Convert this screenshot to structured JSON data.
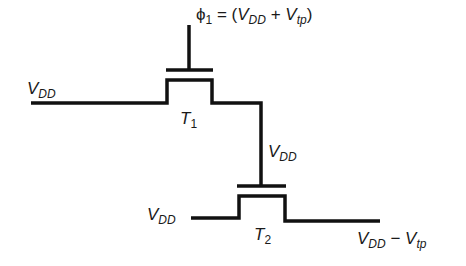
{
  "diagram": {
    "title": "",
    "colors": {
      "line": "#111111",
      "background": "#ffffff",
      "text": "#1a1a1a"
    },
    "gate_label": {
      "symbol": "ϕ",
      "sub": "1",
      "eq": " = (",
      "v1": "V",
      "v1_sub": "DD",
      "plus": " + ",
      "v2": "V",
      "v2_sub": "tp",
      "close": ")"
    },
    "left_vdd": {
      "v": "V",
      "sub": "DD"
    },
    "t1": {
      "t": "T",
      "sub": "1"
    },
    "mid_vdd": {
      "v": "V",
      "sub": "DD"
    },
    "t2_in_vdd": {
      "v": "V",
      "sub": "DD"
    },
    "t2": {
      "t": "T",
      "sub": "2"
    },
    "output": {
      "v1": "V",
      "v1_sub": "DD",
      "minus": " − ",
      "v2": "V",
      "v2_sub": "tp"
    },
    "components": [
      {
        "id": "T1",
        "type": "MOS transistor",
        "gate": "ϕ1 = (VDD + Vtp)",
        "source": "VDD",
        "drain": "gate of T2"
      },
      {
        "id": "T2",
        "type": "MOS transistor",
        "gate": "VDD",
        "input": "VDD",
        "output": "VDD − Vtp"
      }
    ]
  }
}
